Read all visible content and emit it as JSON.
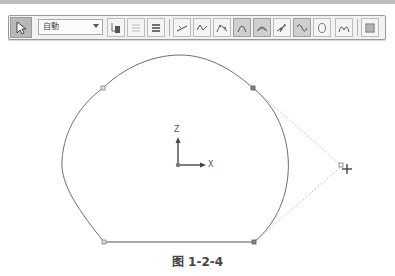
{
  "toolbar": {
    "select_tool": {
      "icon": "select-arrow-icon"
    },
    "mode_dropdown": {
      "value": "自動"
    },
    "buttons": [
      {
        "name": "snap-toggle",
        "icon": "snap-icon"
      },
      {
        "name": "list-light",
        "icon": "list-light-icon"
      },
      {
        "name": "list-heavy",
        "icon": "list-heavy-icon"
      },
      {
        "name": "line",
        "icon": "line-icon"
      },
      {
        "name": "spline",
        "icon": "spline-icon"
      },
      {
        "name": "curve-fit",
        "icon": "curve-fit-icon"
      },
      {
        "name": "arc",
        "icon": "arc-icon"
      },
      {
        "name": "arc-points",
        "icon": "arc-points-icon"
      },
      {
        "name": "trim",
        "icon": "trim-icon"
      },
      {
        "name": "wave",
        "icon": "wave-icon"
      },
      {
        "name": "circle",
        "icon": "circle-icon"
      },
      {
        "name": "multi-curve",
        "icon": "multi-curve-icon"
      },
      {
        "name": "properties",
        "icon": "properties-icon"
      }
    ]
  },
  "drawing": {
    "axis_z_label": "Z",
    "axis_x_label": "X",
    "colors": {
      "curve": "#707070",
      "line": "#555555",
      "control": "#b0b0b0",
      "axis": "#444444"
    }
  },
  "caption": "图 1-2-4"
}
